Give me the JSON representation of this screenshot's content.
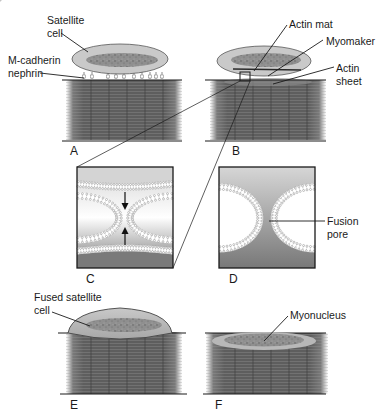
{
  "figure": {
    "panels": {
      "A": {
        "label": "A",
        "annotations": {
          "satellite_cell": [
            "Satellite",
            "cell"
          ],
          "adhesion": [
            "M-cadherin",
            "nephrin"
          ]
        }
      },
      "B": {
        "label": "B",
        "annotations": {
          "actin_mat": "Actin mat",
          "myomaker": "Myomaker",
          "actin_sheet": [
            "Actin",
            "sheet"
          ]
        }
      },
      "C": {
        "label": "C"
      },
      "D": {
        "label": "D",
        "annotations": {
          "fusion_pore": [
            "Fusion",
            "pore"
          ]
        }
      },
      "E": {
        "label": "E",
        "annotations": {
          "fused_cell": [
            "Fused satellite",
            "cell"
          ]
        }
      },
      "F": {
        "label": "F",
        "annotations": {
          "myonucleus": "Myonucleus"
        }
      }
    },
    "colors": {
      "cell_fill": "#c9c9c9",
      "cell_stroke": "#555555",
      "nucleus": "#8a8a8a",
      "fiber_dark": "#5a5a5a",
      "fiber_light": "#8c8c8c",
      "inset_top": "#d4d4d4",
      "inset_bottom": "#7a7a7a",
      "line": "#1a1a1a"
    }
  }
}
